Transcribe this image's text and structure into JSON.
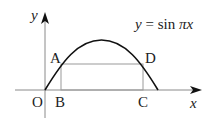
{
  "diagram": {
    "function_label": "y = sin πx",
    "function_parts": {
      "y": "y",
      "eq": " = ",
      "sin": "sin ",
      "pi": "π",
      "x": "x"
    },
    "axes": {
      "x_label": "x",
      "y_label": "y"
    },
    "points": {
      "origin": "O",
      "A": "A",
      "B": "B",
      "C": "C",
      "D": "D"
    },
    "colors": {
      "curve": "#111111",
      "axis": "#888888",
      "rectangle": "#999999",
      "text": "#222222"
    }
  }
}
